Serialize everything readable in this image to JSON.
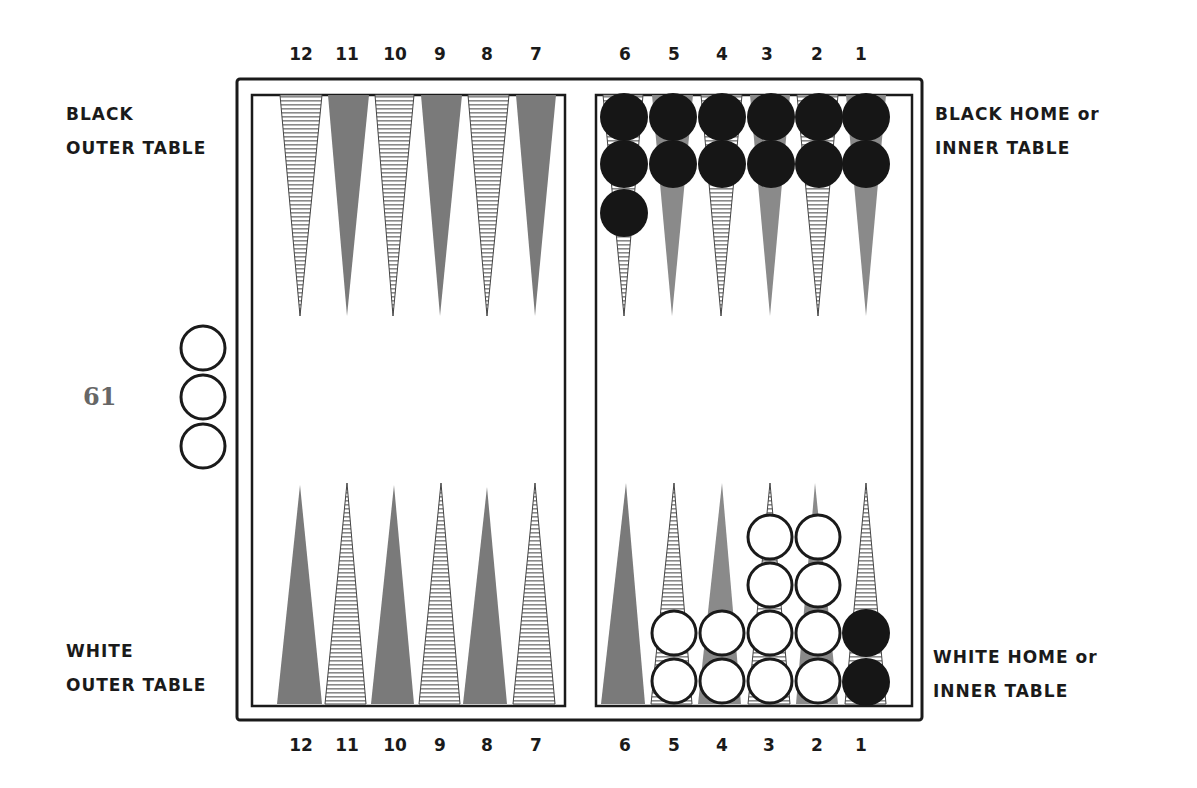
{
  "page_number": "61",
  "labels": {
    "black_outer": [
      "BLACK",
      "OUTER TABLE"
    ],
    "black_home": [
      "BLACK HOME or",
      "INNER TABLE"
    ],
    "white_outer": [
      "WHITE",
      "OUTER TABLE"
    ],
    "white_home": [
      "WHITE HOME or",
      "INNER TABLE"
    ]
  },
  "point_numbers_top": [
    "12",
    "11",
    "10",
    "9",
    "8",
    "7",
    "6",
    "5",
    "4",
    "3",
    "2",
    "1"
  ],
  "point_numbers_bottom": [
    "12",
    "11",
    "10",
    "9",
    "8",
    "7",
    "6",
    "5",
    "4",
    "3",
    "2",
    "1"
  ],
  "colors": {
    "frame": "#1a1a1a",
    "dark_point": "#7a7a7a",
    "hatched_point": "#9a9a9a",
    "black_checker": "#161616",
    "white_checker": "#ffffff"
  },
  "position": {
    "black_checkers": {
      "top_6": 3,
      "top_5": 2,
      "top_4": 2,
      "top_3": 2,
      "top_2": 2,
      "top_1": 2,
      "bottom_1": 2
    },
    "white_checkers": {
      "bottom_5": 2,
      "bottom_4": 2,
      "bottom_3": 4,
      "bottom_2": 4,
      "bar_off_board": 3
    }
  }
}
